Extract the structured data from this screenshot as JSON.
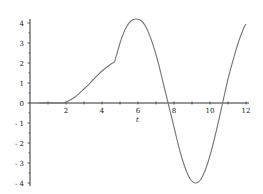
{
  "chart_data": {
    "type": "line",
    "title": "",
    "xlabel": "t",
    "ylabel": "",
    "xlim": [
      0,
      12
    ],
    "ylim": [
      -4,
      4
    ],
    "grid": false,
    "legend": null,
    "x_ticks": [
      2,
      4,
      6,
      8,
      10,
      12
    ],
    "x_tick_labels": [
      "2",
      "4",
      "6",
      "8",
      "10",
      "12"
    ],
    "y_ticks": [
      -4,
      -3,
      -2,
      -1,
      0,
      1,
      2,
      3,
      4
    ],
    "y_tick_labels": [
      "- 4",
      "- 3",
      "- 2",
      "- 1",
      "0",
      "1",
      "2",
      "3",
      "4"
    ],
    "series": [
      {
        "name": "f(t)",
        "color": "#777777",
        "x": [
          0.5,
          1.0,
          1.5,
          1.8,
          2.0,
          2.5,
          3.0,
          3.5,
          4.0,
          4.5,
          4.7,
          5.0,
          5.3,
          5.6,
          5.9,
          6.2,
          6.5,
          6.8,
          7.1,
          7.4,
          7.7,
          8.0,
          8.3,
          8.6,
          8.9,
          9.2,
          9.5,
          9.8,
          10.1,
          10.4,
          10.7,
          11.0,
          11.3,
          11.6,
          11.9,
          12.0
        ],
        "y": [
          0,
          0,
          0,
          0,
          0.05,
          0.3,
          0.7,
          1.15,
          1.6,
          1.95,
          2.05,
          3.0,
          3.7,
          4.1,
          4.2,
          4.1,
          3.7,
          3.0,
          2.1,
          1.0,
          -0.1,
          -1.2,
          -2.3,
          -3.2,
          -3.8,
          -4.0,
          -3.8,
          -3.2,
          -2.3,
          -1.2,
          0.0,
          1.2,
          2.2,
          3.1,
          3.8,
          3.95
        ]
      }
    ]
  }
}
